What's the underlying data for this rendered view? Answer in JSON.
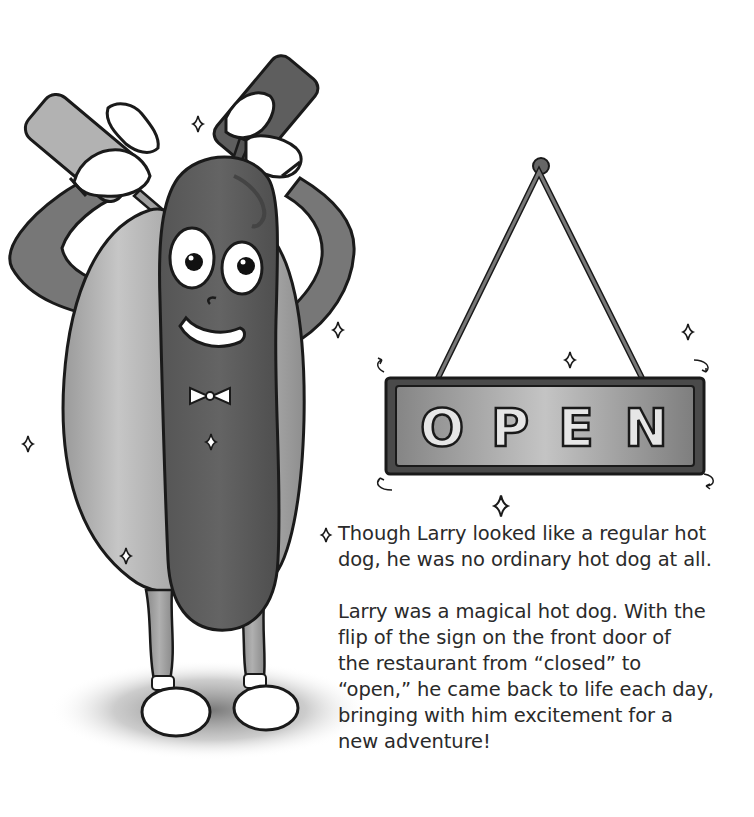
{
  "illustration": {
    "character": "hot-dog",
    "sign": {
      "text": "OPEN",
      "letters": [
        "O",
        "P",
        "E",
        "N"
      ]
    }
  },
  "story": {
    "paragraphs": [
      "Though Larry looked like a regular hot dog, he was no ordinary hot dog at all.",
      "Larry was a magical hot dog. With the flip of the sign on the front door of the restaurant from “closed” to “open,” he came back to life each day, bringing with him excitement for a new adventure!"
    ],
    "lines": [
      [
        "Though Larry looked like a regular hot",
        "dog, he was no ordinary hot dog at all."
      ],
      [
        "Larry was a magical hot dog. With the",
        "flip of the sign on the front door of",
        "the restaurant from “closed” to",
        "“open,” he came back to life each day,",
        "bringing with him excitement for a",
        "new adventure!"
      ]
    ]
  },
  "colors": {
    "background": "#ffffff",
    "text": "#2a2a2a",
    "outline": "#1a1a1a",
    "sausage": "#5c5c5c",
    "bun": "#a8a8a8",
    "sign_plate": "#8f8f8f",
    "sign_frame": "#4a4a4a"
  }
}
